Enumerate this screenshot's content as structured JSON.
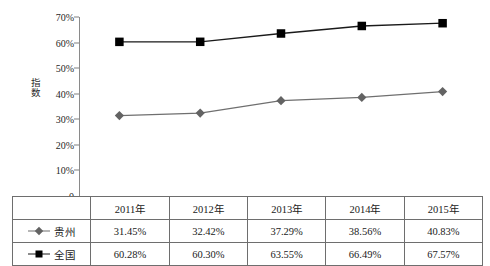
{
  "chart_data": {
    "type": "line",
    "title": "",
    "xlabel": "",
    "ylabel": "指数",
    "categories": [
      "2011年",
      "2012年",
      "2013年",
      "2014年",
      "2015年"
    ],
    "ylim": [
      0,
      70
    ],
    "ytick_labels": [
      "0",
      "10%",
      "20%",
      "30%",
      "40%",
      "50%",
      "60%",
      "70%"
    ],
    "ytick_values": [
      0,
      10,
      20,
      30,
      40,
      50,
      60,
      70
    ],
    "grid": false,
    "legend_position": "table-left",
    "series": [
      {
        "name": "贵州",
        "marker": "diamond",
        "color": "#636363",
        "values": [
          31.45,
          32.42,
          37.29,
          38.56,
          40.83
        ],
        "labels": [
          "31.45%",
          "32.42%",
          "37.29%",
          "38.56%",
          "40.83%"
        ]
      },
      {
        "name": "全国",
        "marker": "square",
        "color": "#000000",
        "values": [
          60.28,
          60.3,
          63.55,
          66.49,
          67.57
        ],
        "labels": [
          "60.28%",
          "60.30%",
          "63.55%",
          "66.49%",
          "67.57%"
        ]
      }
    ]
  },
  "table": {
    "corner_label": "",
    "header": [
      "2011年",
      "2012年",
      "2013年",
      "2014年",
      "2015年"
    ],
    "rows": [
      {
        "label": "贵州",
        "marker_icon": "diamond-marker-icon",
        "cells": [
          "31.45%",
          "32.42%",
          "37.29%",
          "38.56%",
          "40.83%"
        ]
      },
      {
        "label": "全国",
        "marker_icon": "square-marker-icon",
        "cells": [
          "60.28%",
          "60.30%",
          "63.55%",
          "66.49%",
          "67.57%"
        ]
      }
    ]
  },
  "axis": {
    "y_title": "指数",
    "y_ticks": [
      "70%",
      "60%",
      "50%",
      "40%",
      "30%",
      "20%",
      "10%",
      "0"
    ]
  },
  "colors": {
    "guizhou": "#636363",
    "national": "#000000",
    "axis": "#8a8a8a",
    "table_border": "#6e6e6e",
    "background": "#ffffff"
  }
}
